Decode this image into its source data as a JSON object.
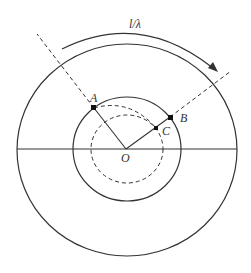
{
  "labels": {
    "arc": "l/λ",
    "A": "A",
    "B": "B",
    "C": "C",
    "O": "O"
  },
  "colors": {
    "stroke": "#333333",
    "background": "#ffffff"
  }
}
